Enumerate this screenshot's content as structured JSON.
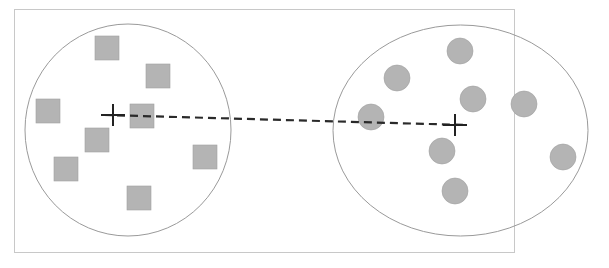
{
  "diagram": {
    "colors": {
      "frame": "#c8c8c8",
      "boundary": "#9a9a9a",
      "marker_fill": "#b4b4b4",
      "marker_stroke": "#a0a0a0",
      "centroid": "#222222",
      "link": "#2a2a2a"
    },
    "frame": {
      "x": 14,
      "y": 9,
      "w": 500,
      "h": 243
    },
    "clusters": [
      {
        "name": "square-cluster",
        "boundary": {
          "cx": 128,
          "cy": 130,
          "rx": 103,
          "ry": 106
        },
        "centroid": {
          "x": 113,
          "y": 115
        },
        "marker_shape": "square",
        "points": [
          {
            "x": 107,
            "y": 48
          },
          {
            "x": 158,
            "y": 76
          },
          {
            "x": 48,
            "y": 111
          },
          {
            "x": 142,
            "y": 116
          },
          {
            "x": 97,
            "y": 140
          },
          {
            "x": 66,
            "y": 169
          },
          {
            "x": 205,
            "y": 157
          },
          {
            "x": 139,
            "y": 198
          }
        ],
        "size": 24
      },
      {
        "name": "circle-cluster",
        "boundary": {
          "cx": 460.5,
          "cy": 130.5,
          "rx": 127.5,
          "ry": 105.5
        },
        "centroid": {
          "x": 455,
          "y": 125
        },
        "marker_shape": "circle",
        "points": [
          {
            "x": 460,
            "y": 51
          },
          {
            "x": 397,
            "y": 78
          },
          {
            "x": 473,
            "y": 99
          },
          {
            "x": 524,
            "y": 104
          },
          {
            "x": 371,
            "y": 117
          },
          {
            "x": 442,
            "y": 151
          },
          {
            "x": 563,
            "y": 157
          },
          {
            "x": 455,
            "y": 191
          }
        ],
        "size": 13
      }
    ],
    "link": {
      "x1": 104,
      "y1": 115,
      "x2": 465,
      "y2": 125,
      "dash": "8 5"
    }
  }
}
